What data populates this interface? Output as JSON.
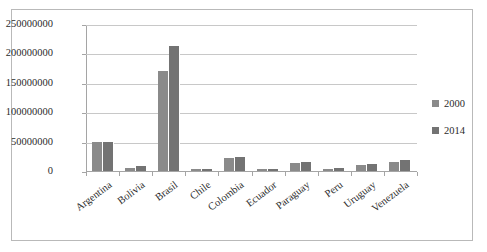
{
  "chart_data": {
    "type": "bar",
    "title": "",
    "xlabel": "",
    "ylabel": "",
    "categories": [
      "Argentina",
      "Bolivia",
      "Brasil",
      "Chile",
      "Colombia",
      "Ecuador",
      "Paraguay",
      "Peru",
      "Uruguay",
      "Venezuela"
    ],
    "series": [
      {
        "name": "2000",
        "values": [
          50000000,
          5000000,
          170000000,
          3000000,
          22000000,
          3000000,
          13000000,
          4000000,
          11000000,
          16000000
        ]
      },
      {
        "name": "2014",
        "values": [
          50000000,
          8000000,
          212000000,
          4000000,
          24000000,
          4000000,
          16000000,
          5000000,
          12000000,
          19000000
        ]
      }
    ],
    "ylim": [
      0,
      250000000
    ],
    "ytick_labels": [
      "250000000",
      "200000000",
      "150000000",
      "100000000",
      "50000000",
      "0"
    ],
    "ytick_values": [
      250000000,
      200000000,
      150000000,
      100000000,
      50000000,
      0
    ],
    "grid": true,
    "legend_position": "right",
    "colors": {
      "series_2000": "#8a8a8a",
      "series_2014": "#737373",
      "gridline": "#c8c8c8",
      "axis": "#a5a5a5",
      "text": "#2b2b2b",
      "border": "#b9b9b9",
      "background": "#ffffff"
    }
  }
}
